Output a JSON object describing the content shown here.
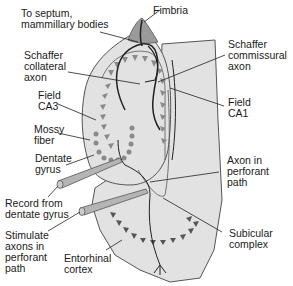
{
  "diagram": {
    "colors": {
      "tissue_fill": "#e2e2e2",
      "outline": "#555555",
      "fimbria_fill": "#9a9a9a",
      "pyramidal_cells": "#8a8a8a",
      "granule_cells": "#8a8a8a",
      "axon": "#222222",
      "electrode": "#b5b5b5"
    },
    "labels": {
      "septum": "To septum,\nmammillary bodies",
      "fimbria": "Fimbria",
      "schaffer_collateral": "Schaffer\ncollateral\naxon",
      "schaffer_commissural": "Schaffer\ncommissural\naxon",
      "field_ca3": "Field\nCA3",
      "field_ca1": "Field\nCA1",
      "mossy_fiber": "Mossy\nfiber",
      "dentate_gyrus": "Dentate\ngyrus",
      "record": "Record from\ndentate gyrus",
      "axon_perforant": "Axon in\nperforant\npath",
      "stimulate": "Stimulate\naxons in\nperforant\npath",
      "subicular": "Subicular\ncomplex",
      "entorhinal": "Entorhinal\ncortex"
    }
  }
}
